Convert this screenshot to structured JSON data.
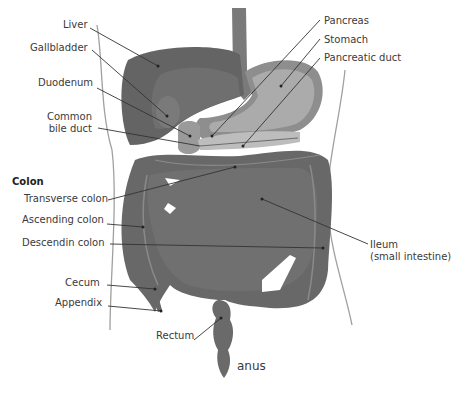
{
  "diagram": {
    "colors": {
      "organ_dark": "#6a6a6a",
      "organ_mid": "#7c7c7c",
      "stomach_light": "#a9a9a9",
      "body_outline": "#9a9a9a",
      "leader_line": "#333333",
      "text": "#3a3a3a"
    },
    "section_heading": "Colon",
    "labels_left": [
      {
        "id": "liver",
        "text": "Liver"
      },
      {
        "id": "gallbladder",
        "text": "Gallbladder"
      },
      {
        "id": "duodenum",
        "text": "Duodenum"
      },
      {
        "id": "common-bile-duct",
        "text": "Common",
        "text2": "bile duct"
      },
      {
        "id": "transverse-colon",
        "text": "Transverse colon"
      },
      {
        "id": "ascending-colon",
        "text": "Ascending colon"
      },
      {
        "id": "descending-colon",
        "text": "Descendin colon"
      },
      {
        "id": "cecum",
        "text": "Cecum"
      },
      {
        "id": "appendix",
        "text": "Appendix"
      },
      {
        "id": "rectum",
        "text": "Rectum"
      }
    ],
    "labels_right": [
      {
        "id": "pancreas",
        "text": "Pancreas"
      },
      {
        "id": "stomach",
        "text": "Stomach"
      },
      {
        "id": "pancreatic-duct",
        "text": "Pancreatic duct"
      },
      {
        "id": "ileum",
        "text": "Ileum",
        "text2": "(small intestine)"
      },
      {
        "id": "anus",
        "text": "anus"
      }
    ]
  }
}
